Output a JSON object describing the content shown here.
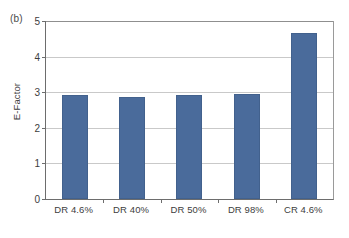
{
  "figure": {
    "panel_label": "(b)",
    "background_color": "#ffffff"
  },
  "chart_data": {
    "type": "bar",
    "title": "",
    "xlabel": "",
    "ylabel": "E-Factor",
    "categories": [
      "DR 4.6%",
      "DR 40%",
      "DR 50%",
      "DR 98%",
      "CR 4.6%"
    ],
    "values": [
      2.92,
      2.86,
      2.93,
      2.94,
      4.66
    ],
    "ylim": [
      0,
      5
    ],
    "yticks": [
      0,
      1,
      2,
      3,
      4,
      5
    ],
    "ytick_labels": [
      "0",
      "1",
      "2",
      "3",
      "4",
      "5"
    ],
    "grid": true,
    "grid_axis": "y",
    "legend": false,
    "bar_color": "#4a6b9b",
    "grid_color": "#c9c9c9",
    "axis_color": "#6d6d6d"
  }
}
